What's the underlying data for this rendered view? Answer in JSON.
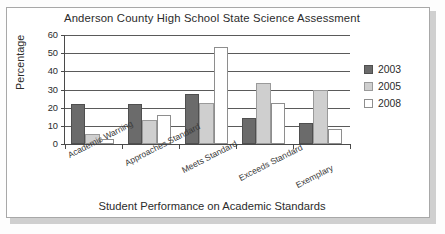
{
  "chart_data": {
    "type": "bar",
    "title": "Anderson County High School State Science Assessment",
    "xlabel": "Student Performance on Academic Standards",
    "ylabel": "Percentage",
    "categories": [
      "Academic Warning",
      "Approaches Standard",
      "Meets Standard",
      "Exceeds Standard",
      "Exemplary"
    ],
    "series": [
      {
        "name": "2003",
        "color": "#6b6b6b",
        "values": [
          22,
          22,
          27.5,
          14.5,
          11.5
        ]
      },
      {
        "name": "2005",
        "color": "#cfcfcf",
        "values": [
          5.5,
          13,
          22.5,
          33.5,
          30
        ]
      },
      {
        "name": "2008",
        "color": "#ffffff",
        "values": [
          2.5,
          16,
          53.5,
          22.5,
          8
        ]
      }
    ],
    "ylim": [
      0,
      60
    ],
    "yticks": [
      0,
      10,
      20,
      30,
      40,
      50,
      60
    ],
    "ytick_labels": [
      "0",
      "10",
      "20",
      "30",
      "40",
      "50",
      "60"
    ],
    "grid": true,
    "legend_position": "right"
  }
}
